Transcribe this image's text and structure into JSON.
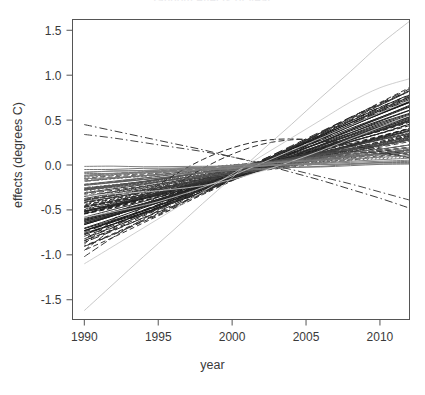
{
  "chart_data": {
    "type": "line",
    "title": "random effects of year",
    "xlabel": "year",
    "ylabel": "effects (degrees C)",
    "xlim": [
      1989.2,
      2012.0
    ],
    "ylim": [
      -1.72,
      1.62
    ],
    "xticks": [
      1990,
      1995,
      2000,
      2005,
      2010
    ],
    "xticklabels": [
      "1990",
      "1995",
      "2000",
      "2005",
      "2010"
    ],
    "yticks": [
      -1.5,
      -1.0,
      -0.5,
      0.0,
      0.5,
      1.0,
      1.5
    ],
    "yticklabels": [
      "-1.5",
      "-1.0",
      "-0.5",
      "0.0",
      "0.5",
      "1.0",
      "1.5"
    ],
    "grid": false,
    "legend": null,
    "x": [
      1990,
      1992,
      1994,
      1996,
      1998,
      2000,
      2002,
      2004,
      2006,
      2008,
      2010,
      2012
    ],
    "series": [
      {
        "name": "s01",
        "style": "solid",
        "shade": "#1a1a1a",
        "values": [
          -0.74,
          -0.63,
          -0.52,
          -0.4,
          -0.27,
          -0.13,
          0.01,
          0.15,
          0.29,
          0.43,
          0.57,
          0.7
        ]
      },
      {
        "name": "s02",
        "style": "solid",
        "shade": "#1a1a1a",
        "values": [
          -0.7,
          -0.6,
          -0.49,
          -0.38,
          -0.26,
          -0.13,
          0.0,
          0.14,
          0.27,
          0.4,
          0.53,
          0.66
        ]
      },
      {
        "name": "s03",
        "style": "solid",
        "shade": "#222222",
        "values": [
          -0.66,
          -0.57,
          -0.47,
          -0.36,
          -0.25,
          -0.13,
          -0.01,
          0.12,
          0.24,
          0.37,
          0.49,
          0.61
        ]
      },
      {
        "name": "s04",
        "style": "solid",
        "shade": "#262626",
        "values": [
          -0.62,
          -0.53,
          -0.44,
          -0.34,
          -0.24,
          -0.13,
          -0.01,
          0.1,
          0.22,
          0.34,
          0.46,
          0.57
        ]
      },
      {
        "name": "s05",
        "style": "solid",
        "shade": "#2b2b2b",
        "values": [
          -0.58,
          -0.5,
          -0.41,
          -0.32,
          -0.22,
          -0.12,
          -0.02,
          0.09,
          0.2,
          0.31,
          0.42,
          0.53
        ]
      },
      {
        "name": "s06",
        "style": "solid",
        "shade": "#303030",
        "values": [
          -0.55,
          -0.47,
          -0.39,
          -0.3,
          -0.21,
          -0.12,
          -0.02,
          0.07,
          0.17,
          0.28,
          0.38,
          0.49
        ]
      },
      {
        "name": "s07",
        "style": "dashed",
        "shade": "#1f1f1f",
        "values": [
          -0.52,
          -0.45,
          -0.37,
          -0.29,
          -0.2,
          -0.11,
          -0.02,
          0.07,
          0.16,
          0.26,
          0.35,
          0.45
        ]
      },
      {
        "name": "s08",
        "style": "dashed",
        "shade": "#232323",
        "values": [
          -0.49,
          -0.42,
          -0.35,
          -0.27,
          -0.19,
          -0.11,
          -0.02,
          0.06,
          0.15,
          0.24,
          0.33,
          0.42
        ]
      },
      {
        "name": "s09",
        "style": "dashed",
        "shade": "#2a2a2a",
        "values": [
          -0.46,
          -0.4,
          -0.33,
          -0.26,
          -0.18,
          -0.1,
          -0.02,
          0.06,
          0.14,
          0.22,
          0.31,
          0.39
        ]
      },
      {
        "name": "s10",
        "style": "dashed",
        "shade": "#333333",
        "values": [
          -0.43,
          -0.37,
          -0.31,
          -0.24,
          -0.17,
          -0.1,
          -0.02,
          0.05,
          0.13,
          0.21,
          0.29,
          0.37
        ]
      },
      {
        "name": "s11",
        "style": "dotted",
        "shade": "#2e2e2e",
        "values": [
          -0.41,
          -0.35,
          -0.29,
          -0.23,
          -0.16,
          -0.09,
          -0.02,
          0.05,
          0.12,
          0.19,
          0.27,
          0.34
        ]
      },
      {
        "name": "s12",
        "style": "dotted",
        "shade": "#383838",
        "values": [
          -0.38,
          -0.33,
          -0.27,
          -0.21,
          -0.15,
          -0.09,
          -0.02,
          0.04,
          0.11,
          0.18,
          0.25,
          0.32
        ]
      },
      {
        "name": "s13",
        "style": "solid",
        "shade": "#3d3d3d",
        "values": [
          -0.35,
          -0.3,
          -0.25,
          -0.2,
          -0.14,
          -0.08,
          -0.02,
          0.04,
          0.1,
          0.16,
          0.23,
          0.29
        ]
      },
      {
        "name": "s14",
        "style": "dashed",
        "shade": "#444444",
        "values": [
          -0.33,
          -0.28,
          -0.23,
          -0.18,
          -0.13,
          -0.08,
          -0.02,
          0.03,
          0.09,
          0.15,
          0.21,
          0.27
        ]
      },
      {
        "name": "s15",
        "style": "longdash",
        "shade": "#1c1c1c",
        "values": [
          -0.8,
          -0.68,
          -0.55,
          -0.42,
          -0.28,
          -0.13,
          0.02,
          0.17,
          0.32,
          0.47,
          0.62,
          0.76
        ]
      },
      {
        "name": "s16",
        "style": "longdash",
        "shade": "#282828",
        "values": [
          -0.86,
          -0.73,
          -0.59,
          -0.45,
          -0.3,
          -0.14,
          0.02,
          0.18,
          0.34,
          0.5,
          0.65,
          0.8
        ]
      },
      {
        "name": "s17",
        "style": "dashed",
        "shade": "#353535",
        "values": [
          -0.9,
          -0.76,
          -0.61,
          -0.46,
          -0.3,
          -0.14,
          0.02,
          0.19,
          0.35,
          0.51,
          0.67,
          0.83
        ]
      },
      {
        "name": "s18",
        "style": "solid",
        "shade": "#4a4a4a",
        "values": [
          -0.3,
          -0.26,
          -0.22,
          -0.17,
          -0.12,
          -0.07,
          -0.02,
          0.03,
          0.08,
          0.13,
          0.18,
          0.24
        ]
      },
      {
        "name": "s19",
        "style": "dotted",
        "shade": "#505050",
        "values": [
          -0.27,
          -0.23,
          -0.19,
          -0.15,
          -0.11,
          -0.06,
          -0.02,
          0.02,
          0.07,
          0.12,
          0.16,
          0.21
        ]
      },
      {
        "name": "s20",
        "style": "dashed",
        "shade": "#565656",
        "values": [
          -0.24,
          -0.21,
          -0.17,
          -0.13,
          -0.1,
          -0.06,
          -0.02,
          0.02,
          0.06,
          0.1,
          0.14,
          0.18
        ]
      },
      {
        "name": "s21",
        "style": "solid",
        "shade": "#5d5d5d",
        "values": [
          -0.21,
          -0.18,
          -0.15,
          -0.12,
          -0.08,
          -0.05,
          -0.01,
          0.02,
          0.05,
          0.09,
          0.12,
          0.16
        ]
      },
      {
        "name": "s22",
        "style": "dashed",
        "shade": "#636363",
        "values": [
          -0.18,
          -0.15,
          -0.13,
          -0.1,
          -0.07,
          -0.04,
          -0.01,
          0.01,
          0.04,
          0.07,
          0.1,
          0.13
        ]
      },
      {
        "name": "s23",
        "style": "dotted",
        "shade": "#6b6b6b",
        "values": [
          -0.14,
          -0.12,
          -0.1,
          -0.08,
          -0.06,
          -0.03,
          -0.01,
          0.01,
          0.03,
          0.06,
          0.08,
          0.1
        ]
      },
      {
        "name": "s24",
        "style": "solid",
        "shade": "#757575",
        "values": [
          -0.1,
          -0.09,
          -0.07,
          -0.06,
          -0.04,
          -0.02,
          -0.01,
          0.01,
          0.02,
          0.04,
          0.06,
          0.07
        ]
      },
      {
        "name": "s25",
        "style": "curve-hump",
        "shade": "#2a2a2a",
        "values": [
          -0.88,
          -0.6,
          -0.34,
          -0.12,
          0.06,
          0.19,
          0.27,
          0.29,
          0.27,
          0.22,
          0.15,
          0.08
        ]
      },
      {
        "name": "s26",
        "style": "curve-hump2",
        "shade": "#333333",
        "values": [
          -0.95,
          -0.7,
          -0.46,
          -0.24,
          -0.04,
          0.12,
          0.23,
          0.28,
          0.28,
          0.24,
          0.18,
          0.11
        ]
      },
      {
        "name": "s27",
        "style": "curve-hump3",
        "shade": "#3a3a3a",
        "values": [
          -1.02,
          -0.8,
          -0.6,
          -0.42,
          -0.25,
          -0.1,
          0.02,
          0.1,
          0.14,
          0.15,
          0.13,
          0.09
        ]
      },
      {
        "name": "s28",
        "style": "dashdot",
        "shade": "#3a3a3a",
        "values": [
          0.45,
          0.38,
          0.31,
          0.24,
          0.17,
          0.09,
          0.01,
          -0.08,
          -0.17,
          -0.27,
          -0.37,
          -0.48
        ]
      },
      {
        "name": "s29",
        "style": "dashdot",
        "shade": "#454545",
        "values": [
          0.34,
          0.3,
          0.25,
          0.2,
          0.15,
          0.09,
          0.02,
          -0.05,
          -0.13,
          -0.21,
          -0.3,
          -0.39
        ]
      },
      {
        "name": "s30",
        "style": "steep",
        "shade": "#b9b9b9",
        "values": [
          -1.62,
          -1.32,
          -1.02,
          -0.73,
          -0.43,
          -0.14,
          0.16,
          0.45,
          0.75,
          1.04,
          1.34,
          1.6
        ]
      },
      {
        "name": "s31",
        "style": "steep2",
        "shade": "#c2c2c2",
        "values": [
          -1.1,
          -0.9,
          -0.7,
          -0.5,
          -0.3,
          -0.1,
          0.1,
          0.3,
          0.5,
          0.7,
          0.86,
          0.96
        ]
      },
      {
        "name": "s32",
        "style": "light",
        "shade": "#cfcfcf",
        "values": [
          -0.58,
          -0.52,
          -0.45,
          -0.36,
          -0.25,
          -0.12,
          0.02,
          0.16,
          0.3,
          0.44,
          0.58,
          0.72
        ]
      },
      {
        "name": "s33",
        "style": "light",
        "shade": "#d6d6d6",
        "values": [
          -0.34,
          -0.32,
          -0.3,
          -0.27,
          -0.23,
          -0.16,
          -0.07,
          0.04,
          0.16,
          0.29,
          0.42,
          0.55
        ]
      },
      {
        "name": "s34",
        "style": "solid",
        "shade": "#808080",
        "values": [
          -0.06,
          -0.05,
          -0.05,
          -0.04,
          -0.03,
          -0.02,
          0.0,
          0.01,
          0.02,
          0.03,
          0.04,
          0.05
        ]
      }
    ]
  }
}
